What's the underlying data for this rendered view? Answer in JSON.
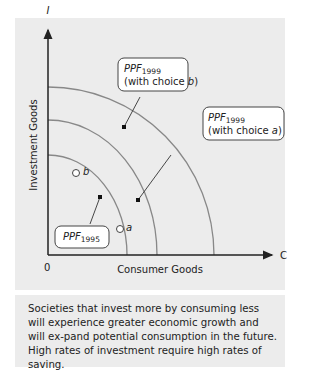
{
  "figure": {
    "y_axis_symbol": "I",
    "x_axis_symbol": "C",
    "origin_label": "0",
    "y_axis_label": "Investment Goods",
    "x_axis_label": "Consumer Goods"
  },
  "callouts": {
    "ppf1999b": {
      "main": "PPF",
      "sub": "1999",
      "line2": "(with choice ",
      "choice": "b",
      "close": ")"
    },
    "ppf1999a": {
      "main": "PPF",
      "sub": "1999",
      "line2": "(with choice ",
      "choice": "a",
      "close": ")"
    },
    "ppf1995": {
      "main": "PPF",
      "sub": "1995"
    }
  },
  "points": {
    "a": "a",
    "b": "b"
  },
  "caption": "Societies that invest more by consuming less will experience greater economic growth and will ex-pand potential consumption in the future.  High rates of investment require high rates of saving.",
  "colors": {
    "panel_bg": "#ececec",
    "curve": "#888888",
    "axis": "#222222"
  }
}
